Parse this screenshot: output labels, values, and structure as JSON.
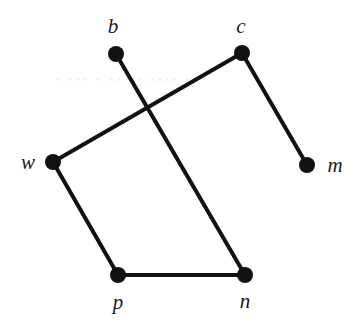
{
  "figure": {
    "background_color": "#ffffff",
    "ink_color": "#111111",
    "width": 360,
    "height": 326,
    "artifact_text": "  ▪  ▪▪▪ ▪ ▪▪  ▪▪ ▪▪▪▪  ▪"
  },
  "chart_data": {
    "type": "diagram",
    "title": "",
    "subtitle": "",
    "xlabel": "",
    "ylabel": "",
    "layout": "node-link graph, undirected, straight edges, one edge crossing",
    "grid": false,
    "legend": null,
    "node_radius": 8,
    "edge_width": 4,
    "nodes": [
      {
        "id": "b",
        "label": "b",
        "x": 116,
        "y": 54,
        "label_x": 113,
        "label_y": 26
      },
      {
        "id": "c",
        "label": "c",
        "x": 242,
        "y": 53,
        "label_x": 241,
        "label_y": 26
      },
      {
        "id": "w",
        "label": "w",
        "x": 53,
        "y": 162,
        "label_x": 28,
        "label_y": 162
      },
      {
        "id": "m",
        "label": "m",
        "x": 307,
        "y": 165,
        "label_x": 335,
        "label_y": 165
      },
      {
        "id": "p",
        "label": "p",
        "x": 118,
        "y": 275,
        "label_x": 118,
        "label_y": 302
      },
      {
        "id": "n",
        "label": "n",
        "x": 245,
        "y": 275,
        "label_x": 245,
        "label_y": 301
      }
    ],
    "edges": [
      {
        "source": "b",
        "target": "n"
      },
      {
        "source": "c",
        "target": "w"
      },
      {
        "source": "c",
        "target": "m"
      },
      {
        "source": "w",
        "target": "p"
      },
      {
        "source": "p",
        "target": "n"
      }
    ],
    "crossings": [
      {
        "edges": [
          "b-n",
          "c-w"
        ],
        "x": 152,
        "y": 110
      }
    ]
  }
}
